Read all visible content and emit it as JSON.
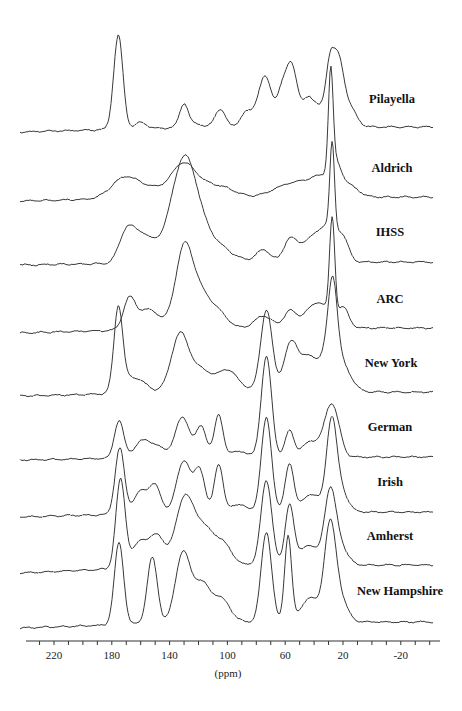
{
  "chart_data": {
    "type": "line",
    "title": "",
    "xlabel": "(ppm)",
    "ylabel": "",
    "xlim": [
      238,
      -42
    ],
    "x_reversed": true,
    "grid": false,
    "legend_position": "inline-right",
    "x_ticks": [
      220,
      180,
      140,
      100,
      60,
      20,
      -20
    ],
    "x_tick_labels": [
      "220",
      "180",
      "140",
      "100",
      "60",
      "20",
      "-20"
    ],
    "minor_tick_step": 10,
    "series": [
      {
        "name": "Pilayella",
        "baseline_y": 127,
        "left_offset": 5,
        "label_y": 99,
        "peaks": [
          [
            175.5,
            94,
            3.2
          ],
          [
            160,
            6,
            4
          ],
          [
            130,
            24,
            3
          ],
          [
            121,
            3,
            4
          ],
          [
            105,
            18,
            3.5
          ],
          [
            87,
            14,
            4
          ],
          [
            74,
            50,
            5
          ],
          [
            63,
            22,
            3
          ],
          [
            56,
            64,
            4.2
          ],
          [
            44,
            28,
            4
          ],
          [
            36,
            15,
            4
          ],
          [
            29,
            58,
            3
          ],
          [
            23,
            58,
            3.5
          ],
          [
            16,
            20,
            5
          ]
        ]
      },
      {
        "name": "Aldrich",
        "baseline_y": 197,
        "left_offset": 4,
        "label_y": 168,
        "peaks": [
          [
            172,
            18,
            9
          ],
          [
            155,
            10,
            12
          ],
          [
            131,
            28,
            8
          ],
          [
            116,
            12,
            12
          ],
          [
            100,
            4,
            8
          ],
          [
            62,
            6,
            10
          ],
          [
            47,
            12,
            12
          ],
          [
            33,
            14,
            8
          ],
          [
            28.5,
            98,
            1.6
          ],
          [
            25,
            24,
            4
          ],
          [
            15,
            10,
            6
          ]
        ]
      },
      {
        "name": "IHSS",
        "baseline_y": 262,
        "left_offset": 3,
        "label_y": 232,
        "peaks": [
          [
            170,
            30,
            5
          ],
          [
            160,
            25,
            6
          ],
          [
            150,
            10,
            6
          ],
          [
            130,
            100,
            9
          ],
          [
            112,
            20,
            12
          ],
          [
            75,
            12,
            5
          ],
          [
            57,
            20,
            4
          ],
          [
            43,
            22,
            8
          ],
          [
            30,
            30,
            6
          ],
          [
            27.5,
            86,
            1.6
          ],
          [
            20,
            20,
            4
          ]
        ]
      },
      {
        "name": "ARC",
        "baseline_y": 328,
        "left_offset": 5,
        "label_y": 299,
        "peaks": [
          [
            168,
            28,
            4
          ],
          [
            155,
            20,
            8
          ],
          [
            130,
            78,
            6
          ],
          [
            118,
            32,
            7
          ],
          [
            105,
            12,
            6
          ],
          [
            75,
            12,
            6
          ],
          [
            57,
            16,
            4
          ],
          [
            45,
            12,
            6
          ],
          [
            35,
            22,
            6
          ],
          [
            27.5,
            98,
            1.8
          ],
          [
            20,
            20,
            4
          ]
        ]
      },
      {
        "name": "New York",
        "baseline_y": 392,
        "left_offset": 4,
        "label_y": 363,
        "peaks": [
          [
            175.5,
            82,
            3
          ],
          [
            165,
            16,
            8
          ],
          [
            133,
            56,
            6
          ],
          [
            118,
            22,
            8
          ],
          [
            100,
            20,
            6
          ],
          [
            90,
            4,
            6
          ],
          [
            73,
            82,
            4
          ],
          [
            56,
            48,
            5
          ],
          [
            43,
            34,
            6
          ],
          [
            29.5,
            40,
            5
          ],
          [
            27,
            68,
            3
          ],
          [
            20,
            24,
            6
          ]
        ]
      },
      {
        "name": "German",
        "baseline_y": 457,
        "left_offset": 3,
        "label_y": 427,
        "peaks": [
          [
            175,
            38,
            3.2
          ],
          [
            160,
            14,
            5
          ],
          [
            150,
            12,
            6
          ],
          [
            131,
            40,
            5
          ],
          [
            118,
            30,
            3.5
          ],
          [
            106,
            42,
            3
          ],
          [
            92,
            6,
            5
          ],
          [
            73,
            100,
            3.6
          ],
          [
            57,
            26,
            3
          ],
          [
            42,
            16,
            6
          ],
          [
            30,
            34,
            4
          ],
          [
            25,
            30,
            4
          ]
        ]
      },
      {
        "name": "Irish",
        "baseline_y": 512,
        "left_offset": 5,
        "label_y": 483,
        "peaks": [
          [
            174.5,
            66,
            3.2
          ],
          [
            160,
            22,
            5
          ],
          [
            150,
            26,
            4
          ],
          [
            130,
            52,
            5
          ],
          [
            119,
            40,
            3.5
          ],
          [
            106,
            48,
            3
          ],
          [
            92,
            8,
            5
          ],
          [
            73,
            94,
            3.6
          ],
          [
            57,
            48,
            3
          ],
          [
            42,
            18,
            6
          ],
          [
            28,
            84,
            3.5
          ],
          [
            22,
            22,
            5
          ]
        ]
      },
      {
        "name": "Amherst",
        "baseline_y": 565,
        "left_offset": 8,
        "label_y": 536,
        "peaks": [
          [
            174,
            88,
            3.2
          ],
          [
            160,
            26,
            6
          ],
          [
            148,
            28,
            5
          ],
          [
            130,
            64,
            6
          ],
          [
            117,
            36,
            7
          ],
          [
            103,
            20,
            6
          ],
          [
            73,
            84,
            3.8
          ],
          [
            57,
            60,
            3
          ],
          [
            44,
            20,
            6
          ],
          [
            29,
            70,
            4
          ],
          [
            22,
            18,
            5
          ]
        ]
      },
      {
        "name": "New Hampshire",
        "baseline_y": 622,
        "left_offset": 6,
        "label_y": 591,
        "peaks": [
          [
            175,
            82,
            3.2
          ],
          [
            152,
            66,
            3.5
          ],
          [
            131,
            68,
            5
          ],
          [
            118,
            38,
            6
          ],
          [
            104,
            22,
            6
          ],
          [
            73,
            90,
            3.6
          ],
          [
            58,
            86,
            2.4
          ],
          [
            43,
            24,
            6
          ],
          [
            29,
            92,
            4
          ],
          [
            22,
            22,
            5
          ]
        ]
      }
    ]
  },
  "axis": {
    "title": "(ppm)",
    "tick_labels": [
      "220",
      "180",
      "140",
      "100",
      "60",
      "20",
      "-20"
    ]
  },
  "labels": [
    "Pilayella",
    "Aldrich",
    "IHSS",
    "ARC",
    "New York",
    "German",
    "Irish",
    "Amherst",
    "New Hampshire"
  ],
  "colors": {
    "trace": "#3a3a3a",
    "axis": "#333333",
    "background": "#ffffff"
  }
}
